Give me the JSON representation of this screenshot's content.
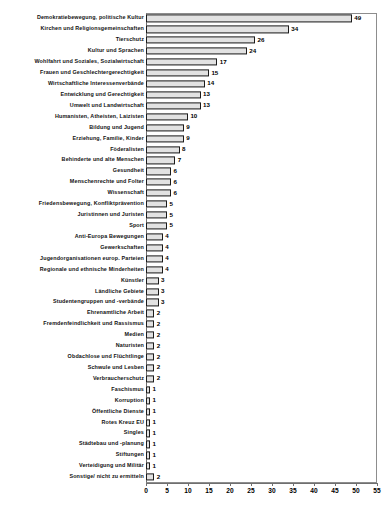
{
  "chart_data": {
    "type": "bar",
    "orientation": "horizontal",
    "title": "",
    "subtitle": "",
    "xlabel": "",
    "ylabel": "",
    "xlim": [
      0,
      55
    ],
    "xticks": [
      0,
      5,
      10,
      15,
      20,
      25,
      30,
      35,
      40,
      45,
      50,
      55
    ],
    "grid": false,
    "legend": null,
    "bar_fill_color": "#e2e2e2",
    "bar_border_color": "#1b1b1b",
    "axis_color": "#6f6f6f",
    "categories": [
      "Demokratiebewegung, politische Kultur",
      "Kirchen und Religionsgemeinschaften",
      "Tierschutz",
      "Kultur und Sprachen",
      "Wohlfahrt und Soziales, Sozialwirtschaft",
      "Frauen und Geschlechtergerechtigkeit",
      "Wirtschaftliche Interessenverbände",
      "Entwicklung und Gerechtigkeit",
      "Umwelt und Landwirtschaft",
      "Humanisten, Atheisten, Laizisten",
      "Bildung und Jugend",
      "Erziehung, Familie, Kinder",
      "Föderalisten",
      "Behinderte und alte Menschen",
      "Gesundheit",
      "Menschenrechte und Folter",
      "Wissenschaft",
      "Friedensbewegung, Konfliktprävention",
      "Juristinnen und Juristen",
      "Sport",
      "Anti-Europa Bewegungen",
      "Gewerkschaften",
      "Jugendorganisationen europ. Parteien",
      "Regionale und ethnische Minderheiten",
      "Künstler",
      "Ländliche Gebiete",
      "Studentengruppen und -verbände",
      "Ehrenamtliche Arbeit",
      "Fremdenfeindlichkeit und Rassismus",
      "Medien",
      "Naturisten",
      "Obdachlose und Flüchtlinge",
      "Schwule und Lesben",
      "Verbraucherschutz",
      "Faschismus",
      "Korruption",
      "Öffentliche Dienste",
      "Rotes Kreuz EU",
      "Singles",
      "Städtebau und -planung",
      "Stiftungen",
      "Verteidigung und Militär",
      "Sonstige/ nicht zu ermitteln"
    ],
    "values": [
      49,
      34,
      26,
      24,
      17,
      15,
      14,
      13,
      13,
      10,
      9,
      9,
      8,
      7,
      6,
      6,
      6,
      5,
      5,
      5,
      4,
      4,
      4,
      4,
      3,
      3,
      3,
      2,
      2,
      2,
      2,
      2,
      2,
      2,
      1,
      1,
      1,
      1,
      1,
      1,
      1,
      1,
      2
    ]
  }
}
